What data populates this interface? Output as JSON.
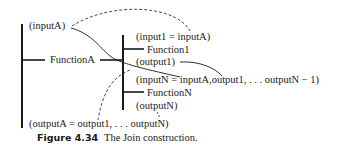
{
  "diagram": {
    "outer": {
      "input_label": "(inputA)",
      "function_label": "FunctionA",
      "output_label": "(outputA = output1,  . . .  outputN)"
    },
    "inner": {
      "function1_input": "(input1 = inputA)",
      "function1_label": "Function1",
      "function1_output": "(output1)",
      "functionN_input": "(inputN = inputA,output1,  . . .  outputN − 1)",
      "functionN_label": "FunctionN",
      "functionN_output": "(outputN)"
    },
    "colors": {
      "ink": "#1a1a1a",
      "background": "#ffffff"
    }
  },
  "caption": {
    "number": "Figure 4.34",
    "text": "The Join construction."
  }
}
